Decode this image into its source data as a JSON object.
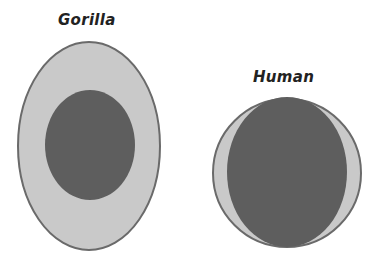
{
  "diagram": {
    "colors": {
      "outer_fill": "#c9c9c9",
      "outline": "#6a6a6a",
      "inner_fill": "#5e5e5e",
      "text": "#222222",
      "background": "#ffffff"
    },
    "figures": [
      {
        "label": "Gorilla",
        "outer": {
          "shape": "ellipse",
          "cx": 89,
          "cy": 146,
          "rx": 71,
          "ry": 104
        },
        "inner": {
          "shape": "ellipse",
          "cx": 90,
          "cy": 145,
          "rx": 45,
          "ry": 55
        }
      },
      {
        "label": "Human",
        "outer": {
          "shape": "circle",
          "cx": 287,
          "cy": 173,
          "rx": 74,
          "ry": 74
        },
        "inner": {
          "shape": "ellipse",
          "cx": 287,
          "cy": 172,
          "rx": 60,
          "ry": 75
        }
      }
    ]
  }
}
